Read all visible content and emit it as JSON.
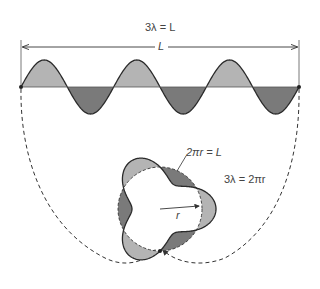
{
  "labels": {
    "top_equation": "3λ = L",
    "length_label": "L",
    "circumference_equation": "2πr = L",
    "wavelength_circle_equation": "3λ = 2πr",
    "radius_label": "r"
  },
  "colors": {
    "light_fill": "#b4b4b4",
    "dark_fill": "#7a7a7a",
    "stroke": "#2a2a2a"
  },
  "wave": {
    "wavelengths": 3,
    "baseline_y": 87,
    "x_start": 21,
    "x_end": 299,
    "amplitude": 27
  },
  "circle": {
    "cx": 160,
    "cy": 209,
    "r": 42,
    "amplitude": 14,
    "wavelengths": 3
  }
}
